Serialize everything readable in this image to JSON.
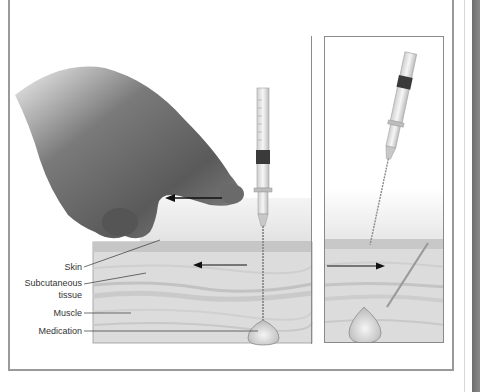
{
  "figure": {
    "labels": {
      "skin": "Skin",
      "subcutaneous_line1": "Subcutaneous",
      "subcutaneous_line2": "tissue",
      "muscle": "Muscle",
      "medication": "Medication"
    },
    "panels": [
      {
        "id": "left",
        "depicts": "hand pulling skin laterally while syringe injects medication into muscle",
        "arrows": [
          "left",
          "left"
        ]
      },
      {
        "id": "right",
        "depicts": "syringe withdrawn, skin released, needle track sealed over medication",
        "arrows": [
          "right"
        ]
      }
    ],
    "colors": {
      "frame": "#9a9a9a",
      "skin": "#c9c9c9",
      "tissue": "#dedede",
      "muscle": "#d2d2d2",
      "medication": "#e6e6e6",
      "arrow": "#111111",
      "strip": "#7a7a7a"
    }
  }
}
